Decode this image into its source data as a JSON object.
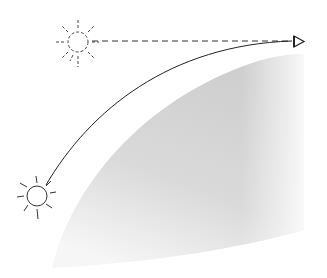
{
  "diagram": {
    "type": "atmospheric-refraction",
    "elements": {
      "apparent_sun": {
        "label": "",
        "cx": 78,
        "cy": 42,
        "r": 11,
        "style": "dashed"
      },
      "real_sun": {
        "label": "",
        "cx": 37,
        "cy": 196,
        "r": 10,
        "style": "solid"
      },
      "observer_eye": {
        "label": "",
        "x": 297,
        "y": 41
      },
      "light_ray": {
        "style": "solid-curve"
      },
      "sight_line": {
        "style": "dashed"
      },
      "earth": {
        "style": "gray-gradient"
      }
    },
    "colors": {
      "line": "#333333",
      "earth_dark": "#c8c8c8",
      "earth_light": "#f4f4f4",
      "background": "#ffffff"
    }
  }
}
